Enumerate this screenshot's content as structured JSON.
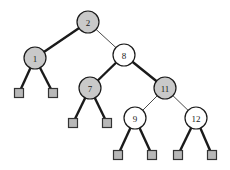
{
  "figure": {
    "width": 230,
    "height": 170,
    "background": "#ffffff"
  },
  "style": {
    "node_radius": 11,
    "node_stroke": "#1a1a1a",
    "node_stroke_width": 1.2,
    "fill_gray": "#c9c9c9",
    "fill_white": "#ffffff",
    "leaf_fill": "#b8b8b8",
    "leaf_stroke": "#333333",
    "leaf_size": 9,
    "edge_color": "#1a1a1a",
    "edge_thick_width": 2.4,
    "edge_thin_width": 0.8,
    "label_color": "#1a1a1a",
    "label_font_size": 9
  },
  "nodes": [
    {
      "id": "n2",
      "label": "2",
      "x": 88,
      "y": 22,
      "color": "gray"
    },
    {
      "id": "n1",
      "label": "1",
      "x": 35,
      "y": 58,
      "color": "gray"
    },
    {
      "id": "n8",
      "label": "8",
      "x": 124,
      "y": 55,
      "color": "white"
    },
    {
      "id": "n7",
      "label": "7",
      "x": 90,
      "y": 88,
      "color": "gray"
    },
    {
      "id": "n11",
      "label": "11",
      "x": 165,
      "y": 88,
      "color": "gray"
    },
    {
      "id": "n9",
      "label": "9",
      "x": 135,
      "y": 118,
      "color": "white"
    },
    {
      "id": "n12",
      "label": "12",
      "x": 196,
      "y": 118,
      "color": "white"
    }
  ],
  "leaves": [
    {
      "id": "l1",
      "x": 19,
      "y": 93,
      "parent": "n1"
    },
    {
      "id": "l2",
      "x": 53,
      "y": 93,
      "parent": "n1"
    },
    {
      "id": "l3",
      "x": 73,
      "y": 123,
      "parent": "n7"
    },
    {
      "id": "l4",
      "x": 107,
      "y": 123,
      "parent": "n7"
    },
    {
      "id": "l5",
      "x": 118,
      "y": 155,
      "parent": "n9"
    },
    {
      "id": "l6",
      "x": 152,
      "y": 155,
      "parent": "n9"
    },
    {
      "id": "l7",
      "x": 178,
      "y": 155,
      "parent": "n12"
    },
    {
      "id": "l8",
      "x": 212,
      "y": 155,
      "parent": "n12"
    }
  ],
  "edges": [
    {
      "id": "e-2-1",
      "from": "n2",
      "to": "n1",
      "weight": "thick"
    },
    {
      "id": "e-2-8",
      "from": "n2",
      "to": "n8",
      "weight": "thin"
    },
    {
      "id": "e-8-7",
      "from": "n8",
      "to": "n7",
      "weight": "thick"
    },
    {
      "id": "e-8-11",
      "from": "n8",
      "to": "n11",
      "weight": "thick"
    },
    {
      "id": "e-11-9",
      "from": "n11",
      "to": "n9",
      "weight": "thin"
    },
    {
      "id": "e-11-12",
      "from": "n11",
      "to": "n12",
      "weight": "thin"
    },
    {
      "id": "e-1-l1",
      "from": "n1",
      "to": "l1",
      "weight": "thick"
    },
    {
      "id": "e-1-l2",
      "from": "n1",
      "to": "l2",
      "weight": "thick"
    },
    {
      "id": "e-7-l3",
      "from": "n7",
      "to": "l3",
      "weight": "thick"
    },
    {
      "id": "e-7-l4",
      "from": "n7",
      "to": "l4",
      "weight": "thick"
    },
    {
      "id": "e-9-l5",
      "from": "n9",
      "to": "l5",
      "weight": "thick"
    },
    {
      "id": "e-9-l6",
      "from": "n9",
      "to": "l6",
      "weight": "thick"
    },
    {
      "id": "e-12-l7",
      "from": "n12",
      "to": "l7",
      "weight": "thick"
    },
    {
      "id": "e-12-l8",
      "from": "n12",
      "to": "l8",
      "weight": "thick"
    }
  ]
}
